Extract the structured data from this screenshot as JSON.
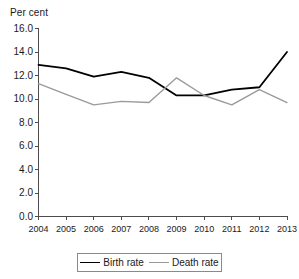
{
  "chart_data": {
    "type": "line",
    "title": "",
    "ylabel": "Per cent",
    "xlabel": "",
    "ylim": [
      0.0,
      16.0
    ],
    "yticks": [
      "0.0",
      "2.0",
      "4.0",
      "6.0",
      "8.0",
      "10.0",
      "12.0",
      "14.0",
      "16.0"
    ],
    "ytick_values": [
      0.0,
      2.0,
      4.0,
      6.0,
      8.0,
      10.0,
      12.0,
      14.0,
      16.0
    ],
    "grid": false,
    "legend_position": "bottom",
    "categories": [
      "2004",
      "2005",
      "2006",
      "2007",
      "2008",
      "2009",
      "2010",
      "2011",
      "2012",
      "2013"
    ],
    "x": [
      2004,
      2005,
      2006,
      2007,
      2008,
      2009,
      2010,
      2011,
      2012,
      2013
    ],
    "series": [
      {
        "name": "Birth rate",
        "color": "#000000",
        "values": [
          12.9,
          12.6,
          11.9,
          12.3,
          11.8,
          10.3,
          10.3,
          10.8,
          11.0,
          14.0
        ]
      },
      {
        "name": "Death rate",
        "color": "#9a9a9a",
        "values": [
          11.3,
          10.4,
          9.5,
          9.8,
          9.7,
          11.8,
          10.3,
          9.5,
          10.8,
          9.7
        ]
      }
    ]
  },
  "axis": {
    "line_color": "#4d4d4d"
  }
}
